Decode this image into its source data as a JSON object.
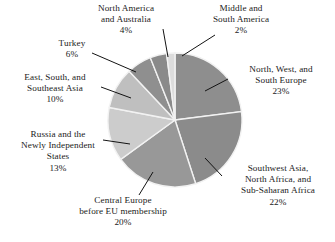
{
  "chart_data": {
    "type": "pie",
    "title": "",
    "subtitle": "",
    "xlabel": "",
    "ylabel": "",
    "legend_position": "none",
    "grid": false,
    "units": "percent",
    "total": 100,
    "start_angle_deg": 0,
    "direction": "clockwise",
    "categories": [
      "North, West, and South Europe",
      "Southwest Asia, North Africa, and Sub-Saharan Africa",
      "Central Europe before EU membership",
      "Russia and the Newly Independent States",
      "East, South, and Southeast Asia",
      "Turkey",
      "North America and Australia",
      "Middle and South America"
    ],
    "values": [
      23,
      22,
      20,
      13,
      10,
      6,
      4,
      2
    ],
    "slices": [
      {
        "name": "North, West, and South Europe",
        "value": 23,
        "pct_label": "23%",
        "color": "#8e8e8e",
        "label_lines": [
          "North, West, and",
          "South Europe"
        ]
      },
      {
        "name": "Southwest Asia, North Africa, and Sub-Saharan Africa",
        "value": 22,
        "pct_label": "22%",
        "color": "#8b8b8b",
        "label_lines": [
          "Southwest Asia,",
          "North Africa, and",
          "Sub-Saharan Africa"
        ]
      },
      {
        "name": "Central Europe before EU membership",
        "value": 20,
        "pct_label": "20%",
        "color": "#989898",
        "label_lines": [
          "Central Europe",
          "before EU membership"
        ]
      },
      {
        "name": "Russia and the Newly Independent States",
        "value": 13,
        "pct_label": "13%",
        "color": "#cccccc",
        "label_lines": [
          "Russia and the",
          "Newly Independent",
          "States"
        ]
      },
      {
        "name": "East, South, and Southeast Asia",
        "value": 10,
        "pct_label": "10%",
        "color": "#bfbfbf",
        "label_lines": [
          "East, South, and",
          "Southeast Asia"
        ]
      },
      {
        "name": "Turkey",
        "value": 6,
        "pct_label": "6%",
        "color": "#8f8f8f",
        "label_lines": [
          "Turkey"
        ]
      },
      {
        "name": "North America and Australia",
        "value": 4,
        "pct_label": "4%",
        "color": "#8a8a8a",
        "label_lines": [
          "North America",
          "and Australia"
        ]
      },
      {
        "name": "Middle and South America",
        "value": 2,
        "pct_label": "2%",
        "color": "#dcdcdc",
        "label_lines": [
          "Middle and",
          "South America"
        ]
      }
    ]
  },
  "labels": {
    "north_america": {
      "line1": "North America",
      "line2": "and Australia",
      "pct": "4%"
    },
    "middle_south_america": {
      "line1": "Middle and",
      "line2": "South America",
      "pct": "2%"
    },
    "turkey": {
      "line1": "Turkey",
      "pct": "6%"
    },
    "nws_europe": {
      "line1": "North, West, and",
      "line2": "South Europe",
      "pct": "23%"
    },
    "east_asia": {
      "line1": "East, South, and",
      "line2": "Southeast Asia",
      "pct": "10%"
    },
    "russia": {
      "line1": "Russia and the",
      "line2": "Newly Independent",
      "line3": "States",
      "pct": "13%"
    },
    "southwest_asia": {
      "line1": "Southwest Asia,",
      "line2": "North Africa, and",
      "line3": "Sub-Saharan Africa",
      "pct": "22%"
    },
    "central_europe": {
      "line1": "Central Europe",
      "line2": "before EU membership",
      "pct": "20%"
    }
  },
  "style": {
    "background": "#ffffff",
    "text_color": "#1b1b1b",
    "slice_divider_color": "#f2f2f2",
    "leader_line_color": "#131313"
  }
}
